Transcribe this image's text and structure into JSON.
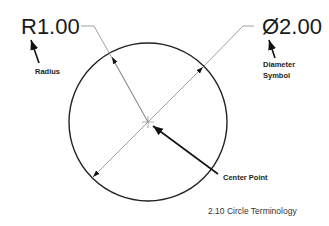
{
  "figure": {
    "radius_dimension": "R1.00",
    "diameter_dimension": "Ø2.00",
    "labels": {
      "radius": "Radius",
      "diameter_line1": "Diameter",
      "diameter_line2": "Symbol",
      "center_point": "Center Point"
    },
    "caption": "2.10 Circle Terminology",
    "colors": {
      "circle": "#222222",
      "leader": "#888888",
      "text": "#1a1a1a"
    }
  }
}
